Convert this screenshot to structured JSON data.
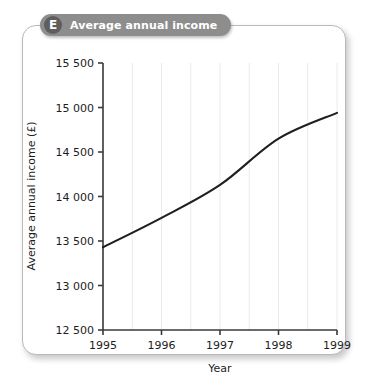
{
  "banner": {
    "letter": "E",
    "title": "Average annual income"
  },
  "chart_data": {
    "type": "line",
    "title": "Average annual income",
    "xlabel": "Year",
    "ylabel": "Average annual income (£)",
    "x": [
      1995,
      1996,
      1997,
      1998,
      1999
    ],
    "categories": [
      "1995",
      "1996",
      "1997",
      "1998",
      "1999"
    ],
    "values": [
      13430,
      13760,
      14130,
      14650,
      14940
    ],
    "series": [
      {
        "name": "Average annual income",
        "values": [
          13430,
          13760,
          14130,
          14650,
          14940
        ]
      }
    ],
    "xlim": [
      1995,
      1999
    ],
    "ylim": [
      12500,
      15500
    ],
    "ytick_labels": [
      "12 500",
      "13 000",
      "13 500",
      "14 000",
      "14 500",
      "15 000",
      "15 500"
    ],
    "ytick_values": [
      12500,
      13000,
      13500,
      14000,
      14500,
      15000,
      15500
    ],
    "xtick_labels": [
      "1995",
      "1996",
      "1997",
      "1998",
      "1999"
    ],
    "grid": "vertical-only",
    "gridline_interval_years": 0.5,
    "legend": "none",
    "line_color": "#1f1f1f",
    "grid_color": "#ebebeb",
    "axis_color": "#3a3a3a"
  }
}
